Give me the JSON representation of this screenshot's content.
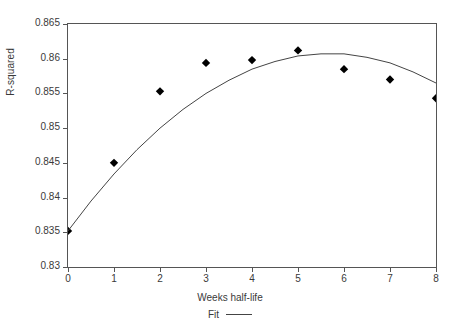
{
  "chart_data": {
    "type": "scatter",
    "title": "",
    "xlabel": "Weeks half-life",
    "ylabel": "R-squared",
    "xlim": [
      0,
      8
    ],
    "ylim": [
      0.83,
      0.865
    ],
    "grid": false,
    "x_ticks": [
      0,
      1,
      2,
      3,
      4,
      5,
      6,
      7,
      8
    ],
    "x_tick_labels": [
      "0",
      "1",
      "2",
      "3",
      "4",
      "5",
      "6",
      "7",
      "8"
    ],
    "y_ticks": [
      0.83,
      0.835,
      0.84,
      0.845,
      0.85,
      0.855,
      0.86,
      0.865
    ],
    "y_tick_labels": [
      "0.83",
      "0.835",
      "0.84",
      "0.845",
      "0.85",
      "0.855",
      "0.86",
      "0.865"
    ],
    "legend_position": "below-axis-center",
    "series": [
      {
        "name": "Observed",
        "type": "scatter",
        "marker": "diamond",
        "color": "#000000",
        "x": [
          0,
          1,
          2,
          3,
          4,
          5,
          6,
          7,
          8
        ],
        "values": [
          0.8352,
          0.845,
          0.8553,
          0.8594,
          0.8598,
          0.8612,
          0.8585,
          0.857,
          0.8543
        ]
      },
      {
        "name": "Fit",
        "type": "line",
        "color": "#444444",
        "x": [
          0,
          0.5,
          1,
          1.5,
          2,
          2.5,
          3,
          3.5,
          4,
          4.5,
          5,
          5.5,
          6,
          6.5,
          7,
          7.5,
          8
        ],
        "values": [
          0.8352,
          0.8395,
          0.8434,
          0.8469,
          0.85,
          0.8527,
          0.855,
          0.8569,
          0.8585,
          0.8596,
          0.8604,
          0.8607,
          0.8607,
          0.8602,
          0.8594,
          0.8581,
          0.8565
        ]
      }
    ],
    "legend": [
      {
        "label": "Fit",
        "marker": "line",
        "color": "#444444"
      }
    ]
  },
  "axis": {
    "y_title": "R-squared",
    "x_title": "Weeks half-life"
  },
  "legend": {
    "fit_label": "Fit"
  }
}
